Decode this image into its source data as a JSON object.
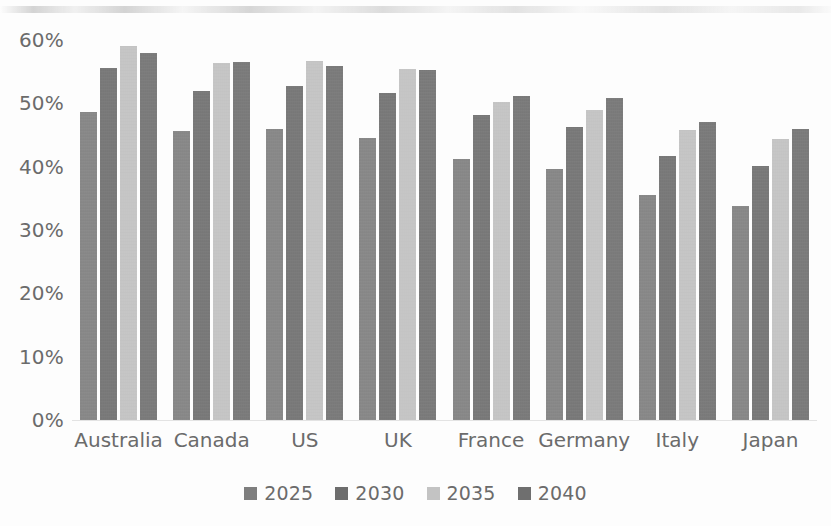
{
  "chart_data": {
    "type": "bar",
    "title": "",
    "subtitle": "",
    "xlabel": "",
    "ylabel": "",
    "ylim": [
      0,
      60
    ],
    "ytick_labels": [
      "60%",
      "50%",
      "40%",
      "30%",
      "20%",
      "10%",
      "0%"
    ],
    "ytick_values": [
      60,
      50,
      40,
      30,
      20,
      10,
      0
    ],
    "grid": false,
    "legend_position": "bottom",
    "categories": [
      "Australia",
      "Canada",
      "US",
      "UK",
      "France",
      "Germany",
      "Italy",
      "Japan"
    ],
    "series": [
      {
        "name": "2025",
        "color": "#7e7e7e",
        "values": [
          48.6,
          45.6,
          46.0,
          44.5,
          41.2,
          39.7,
          35.5,
          33.8
        ]
      },
      {
        "name": "2030",
        "color": "#6d6d6d",
        "values": [
          55.6,
          52.0,
          52.8,
          51.6,
          48.1,
          46.2,
          41.7,
          40.1
        ]
      },
      {
        "name": "2035",
        "color": "#c3c3c3",
        "values": [
          59.1,
          56.3,
          56.7,
          55.5,
          50.2,
          48.9,
          45.8,
          44.3
        ]
      },
      {
        "name": "2040",
        "color": "#6f6f6f",
        "values": [
          58.0,
          56.6,
          55.9,
          55.3,
          51.1,
          50.9,
          47.0,
          46.0
        ]
      }
    ]
  }
}
